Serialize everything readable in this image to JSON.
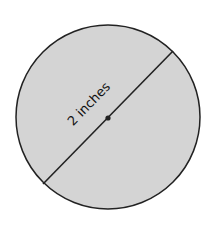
{
  "diagram": {
    "shape": "circle",
    "fill_color": "#d4d4d4",
    "stroke_color": "#222222",
    "segment": "diameter",
    "center_point": true,
    "label": "2 inches"
  }
}
